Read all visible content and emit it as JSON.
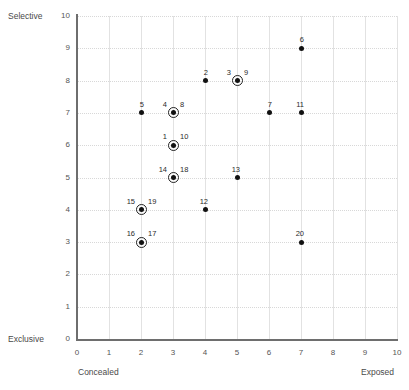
{
  "chart_data": {
    "type": "scatter",
    "title": "",
    "xlabel": "",
    "ylabel": "",
    "xlim": [
      0,
      10
    ],
    "ylim": [
      0,
      10
    ],
    "grid": true,
    "legend": false,
    "axis_captions": {
      "y_top": "Selective",
      "y_bottom": "Exclusive",
      "x_left": "Concealed",
      "x_right": "Exposed"
    },
    "xticks": [
      "0",
      "1",
      "2",
      "3",
      "4",
      "5",
      "6",
      "7",
      "8",
      "9",
      "10"
    ],
    "yticks": [
      "0",
      "1",
      "2",
      "3",
      "4",
      "5",
      "6",
      "7",
      "8",
      "9",
      "10"
    ],
    "points": [
      {
        "labels": [
          "5"
        ],
        "x": 2,
        "y": 7,
        "overlapping": false
      },
      {
        "labels": [
          "4",
          "8"
        ],
        "x": 3,
        "y": 7,
        "overlapping": true
      },
      {
        "labels": [
          "7"
        ],
        "x": 6,
        "y": 7,
        "overlapping": false
      },
      {
        "labels": [
          "11"
        ],
        "x": 7,
        "y": 7,
        "overlapping": false
      },
      {
        "labels": [
          "2"
        ],
        "x": 4,
        "y": 8,
        "overlapping": false
      },
      {
        "labels": [
          "3",
          "9"
        ],
        "x": 5,
        "y": 8,
        "overlapping": true
      },
      {
        "labels": [
          "6"
        ],
        "x": 7,
        "y": 9,
        "overlapping": false
      },
      {
        "labels": [
          "1",
          "10"
        ],
        "x": 3,
        "y": 6,
        "overlapping": true
      },
      {
        "labels": [
          "14",
          "18"
        ],
        "x": 3,
        "y": 5,
        "overlapping": true
      },
      {
        "labels": [
          "13"
        ],
        "x": 5,
        "y": 5,
        "overlapping": false
      },
      {
        "labels": [
          "15",
          "19"
        ],
        "x": 2,
        "y": 4,
        "overlapping": true
      },
      {
        "labels": [
          "12"
        ],
        "x": 4,
        "y": 4,
        "overlapping": false
      },
      {
        "labels": [
          "16",
          "17"
        ],
        "x": 2,
        "y": 3,
        "overlapping": true
      },
      {
        "labels": [
          "20"
        ],
        "x": 7,
        "y": 3,
        "overlapping": false
      }
    ],
    "colors": {
      "marker": "#111111",
      "axis": "#6e6e6e",
      "grid": "#e2e2e2",
      "text": "#3a3a3a"
    }
  }
}
